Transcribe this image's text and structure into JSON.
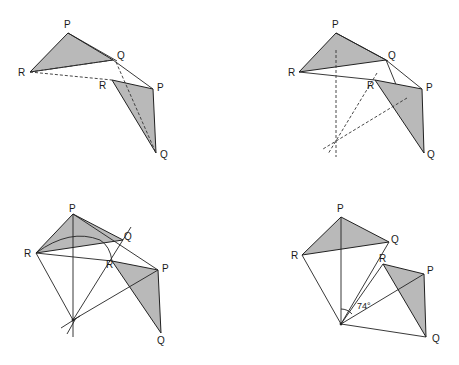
{
  "figure": {
    "panels": [
      {
        "id": "step-1",
        "labels": {
          "P": "P",
          "Q": "Q",
          "R": "R",
          "P2": "P",
          "Q2": "Q",
          "R2": "R"
        }
      },
      {
        "id": "step-2",
        "labels": {
          "P": "P",
          "Q": "Q",
          "R": "R",
          "P2": "P",
          "Q2": "Q",
          "R2": "R"
        }
      },
      {
        "id": "step-3",
        "labels": {
          "P": "P",
          "Q": "Q",
          "R": "R",
          "P2": "P",
          "Q2": "Q",
          "R2": "R"
        }
      },
      {
        "id": "step-4",
        "labels": {
          "P": "P",
          "Q": "Q",
          "R": "R",
          "P2": "P",
          "Q2": "Q",
          "R2": "R"
        },
        "angle_label": "74°"
      }
    ],
    "colors": {
      "shade": "#b9b9b9",
      "line": "#222222",
      "background": "#ffffff"
    }
  }
}
